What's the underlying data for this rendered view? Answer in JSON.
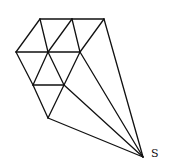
{
  "diagram": {
    "vertices": {
      "A": [
        40,
        19
      ],
      "B": [
        72,
        19
      ],
      "C": [
        104,
        19
      ],
      "D": [
        16,
        52
      ],
      "E": [
        48,
        52
      ],
      "F": [
        80,
        52
      ],
      "G": [
        33,
        85
      ],
      "H": [
        64,
        85
      ],
      "I": [
        48,
        118
      ],
      "S": [
        143,
        157
      ]
    },
    "edges": [
      [
        "A",
        "B"
      ],
      [
        "B",
        "C"
      ],
      [
        "A",
        "D"
      ],
      [
        "A",
        "E"
      ],
      [
        "B",
        "E"
      ],
      [
        "B",
        "F"
      ],
      [
        "C",
        "F"
      ],
      [
        "C",
        "S"
      ],
      [
        "D",
        "E"
      ],
      [
        "E",
        "F"
      ],
      [
        "D",
        "G"
      ],
      [
        "E",
        "G"
      ],
      [
        "E",
        "H"
      ],
      [
        "F",
        "H"
      ],
      [
        "F",
        "S"
      ],
      [
        "G",
        "H"
      ],
      [
        "G",
        "I"
      ],
      [
        "H",
        "I"
      ],
      [
        "H",
        "S"
      ],
      [
        "I",
        "S"
      ]
    ],
    "labels": {
      "apex": "S"
    },
    "stroke_color": "#111111"
  }
}
